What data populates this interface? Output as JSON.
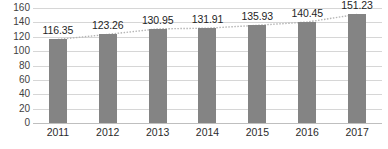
{
  "chart_data": {
    "type": "bar",
    "title": "",
    "xlabel": "",
    "ylabel": "",
    "categories": [
      "2011",
      "2012",
      "2013",
      "2014",
      "2015",
      "2016",
      "2017"
    ],
    "values": [
      116.35,
      123.26,
      130.95,
      131.91,
      135.93,
      140.45,
      151.23
    ],
    "data_labels": [
      "116.35",
      "123.26",
      "130.95",
      "131.91",
      "135.93",
      "140.45",
      "151.23"
    ],
    "ylim": [
      0,
      160
    ],
    "ytick_step": 20,
    "yticks": [
      160,
      140,
      120,
      100,
      80,
      60,
      40,
      20,
      0
    ],
    "ytick_labels": [
      "160",
      "140",
      "120",
      "100",
      "80",
      "60",
      "40",
      "20",
      "0"
    ],
    "grid": true,
    "legend": false,
    "series": [
      {
        "name": "",
        "values": [
          116.35,
          123.26,
          130.95,
          131.91,
          135.93,
          140.45,
          151.23
        ]
      }
    ],
    "trendline": {
      "visible": true,
      "style": "dotted",
      "values": [
        116.35,
        123.26,
        130.95,
        131.91,
        135.93,
        140.45,
        151.23
      ]
    },
    "colors": {
      "bar": "#848484",
      "gridline": "#d6d6d6",
      "axis": "#bfbfbf",
      "label_text": "#1f1f1f",
      "tick_text": "#3f3f3f",
      "background": "#ffffff",
      "trendline": "#b5b5b5"
    }
  }
}
